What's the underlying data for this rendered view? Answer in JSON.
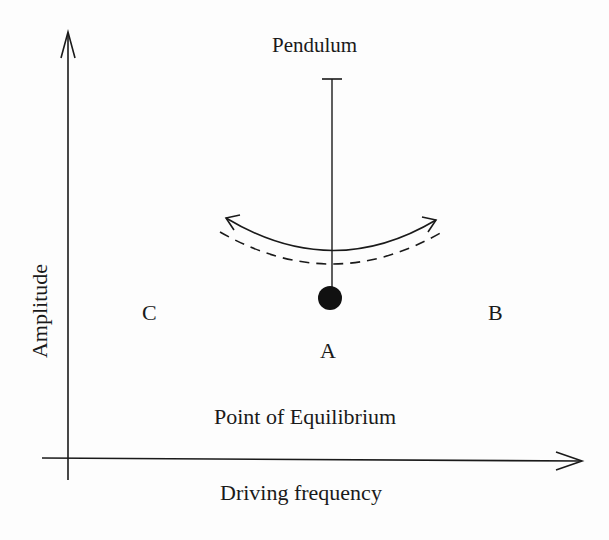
{
  "diagram": {
    "title": "Pendulum",
    "x_axis_label": "Driving frequency",
    "y_axis_label": "Amplitude",
    "points": [
      {
        "id": "A",
        "label": "A"
      },
      {
        "id": "B",
        "label": "B"
      },
      {
        "id": "C",
        "label": "C"
      }
    ],
    "equilibrium_label": "Point of Equilibrium",
    "colors": {
      "ink": "#1a1a1a",
      "background": "#fdfdfd"
    }
  }
}
